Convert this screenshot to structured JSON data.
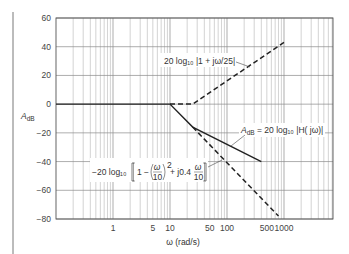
{
  "chart_data": {
    "type": "line",
    "title": "",
    "xlabel": "ω (rad/s)",
    "ylabel": "A_dB",
    "xscale": "log",
    "xlim": [
      0.1,
      10000
    ],
    "ylim": [
      -80,
      60
    ],
    "grid": true,
    "x_tick_labels": [
      "1",
      "5",
      "10",
      "50",
      "100",
      "500",
      "1000"
    ],
    "x_tick_values": [
      1,
      5,
      10,
      50,
      100,
      500,
      1000
    ],
    "y_tick_labels": [
      "60",
      "40",
      "20",
      "0",
      "−20",
      "−40",
      "−60",
      "−80"
    ],
    "y_tick_values": [
      60,
      40,
      20,
      0,
      -20,
      -40,
      -60,
      -80
    ],
    "series": [
      {
        "name": "A_dB = 20 log10 |H(jω)|",
        "style": "solid",
        "points": [
          [
            0.1,
            0
          ],
          [
            10,
            0
          ],
          [
            25,
            -16
          ],
          [
            400,
            -40
          ]
        ]
      },
      {
        "name": "20 log10 |1 + jω/25|",
        "style": "dashed",
        "points": [
          [
            10,
            0
          ],
          [
            25,
            0
          ],
          [
            1000,
            43
          ]
        ]
      },
      {
        "name": "−20 log10 [1 − (ω/10)² + j0.4 ω/10]",
        "style": "dashed",
        "points": [
          [
            25,
            -16
          ],
          [
            800,
            -78
          ]
        ]
      }
    ],
    "annotations": [
      {
        "text": "20 log₁₀ |1 + jω/25|",
        "points_to": "upper dashed asymptote"
      },
      {
        "text": "A_dB = 20 log₁₀ |H(jω)|",
        "points_to": "solid composite curve"
      },
      {
        "text": "−20 log₁₀ [1 − (ω/10)² + j0.4 ω/10]",
        "points_to": "lower dashed asymptote"
      }
    ]
  },
  "labels": {
    "ylabel_main": "A",
    "ylabel_sub": "dB",
    "xlabel": "ω (rad/s)",
    "ann_upper": "20 log₁₀ |1 + jω/25|",
    "ann_mid_a": "A",
    "ann_mid_sub": "dB",
    "ann_mid_rest": " = 20 log₁₀ |H( jω)|",
    "ann_lower_pre": "−20 log₁₀",
    "ann_lower_one": "1 − ",
    "ann_lower_w": "ω",
    "ann_lower_10": "10",
    "ann_lower_sq": "2",
    "ann_lower_plus": " + j0.4",
    "ann_lower_w2": "ω",
    "ann_lower_10b": "10"
  }
}
